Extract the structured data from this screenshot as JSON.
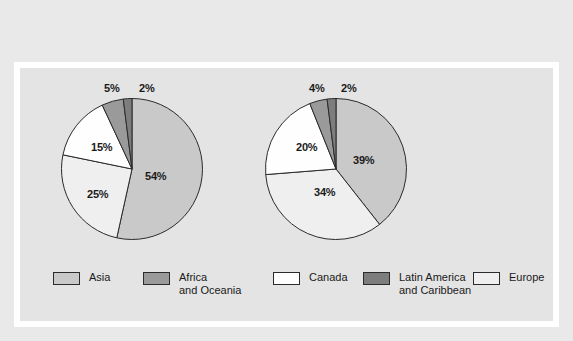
{
  "colors": {
    "page_background": "#e9e9e9",
    "frame": "#ffffff",
    "panel_background": "#e4e4e4",
    "outline": "#2b2b2b",
    "asia": "#c9c9c9",
    "africa_and_oceania": "#9a9a9a",
    "canada": "#fefefe",
    "latin_america_and_caribbean": "#7d7d7d",
    "europe": "#efefef",
    "text": "#1a1a1a"
  },
  "legend": {
    "items": [
      {
        "key": "asia",
        "label": "Asia",
        "swatch": "#c9c9c9"
      },
      {
        "key": "africa_and_oceania",
        "label": "Africa\nand Oceania",
        "swatch": "#9a9a9a"
      },
      {
        "key": "canada",
        "label": "Canada",
        "swatch": "#fefefe"
      },
      {
        "key": "latin_america_and_caribbean",
        "label": "Latin America\nand Caribbean",
        "swatch": "#7d7d7d"
      },
      {
        "key": "europe",
        "label": "Europe",
        "swatch": "#efefef"
      }
    ]
  },
  "chart_data": [
    {
      "type": "pie",
      "id": "pie-1",
      "title": "",
      "categories": [
        "Asia",
        "Europe",
        "Canada",
        "Africa and Oceania",
        "Latin America and Caribbean"
      ],
      "values": [
        54,
        25,
        15,
        5,
        2
      ],
      "labels": [
        "54%",
        "25%",
        "15%",
        "5%",
        "2%"
      ],
      "colors": [
        "#c9c9c9",
        "#efefef",
        "#fefefe",
        "#9a9a9a",
        "#7d7d7d"
      ],
      "start_angle_deg": 0,
      "direction": "clockwise",
      "legend_position": "bottom"
    },
    {
      "type": "pie",
      "id": "pie-2",
      "title": "",
      "categories": [
        "Asia",
        "Europe",
        "Canada",
        "Africa and Oceania",
        "Latin America and Caribbean"
      ],
      "values": [
        39,
        34,
        20,
        4,
        2
      ],
      "labels": [
        "39%",
        "34%",
        "20%",
        "4%",
        "2%"
      ],
      "colors": [
        "#c9c9c9",
        "#efefef",
        "#fefefe",
        "#9a9a9a",
        "#7d7d7d"
      ],
      "start_angle_deg": 0,
      "direction": "clockwise",
      "legend_position": "bottom"
    }
  ],
  "pie1_labels": {
    "asia": "54%",
    "europe": "25%",
    "canada": "15%",
    "africa": "5%",
    "latin": "2%"
  },
  "pie2_labels": {
    "asia": "39%",
    "europe": "34%",
    "canada": "20%",
    "africa": "4%",
    "latin": "2%"
  }
}
